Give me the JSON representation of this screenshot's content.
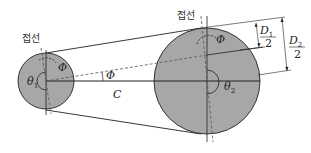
{
  "diagram": {
    "type": "belt-pulley-geometry",
    "colors": {
      "pulley_fill": "#a7a7a7",
      "line": "#222222",
      "dashed": "#555555"
    },
    "labels": {
      "tangent_left": "접선",
      "tangent_right": "접선",
      "phi_small": "Φ",
      "phi_center": "Φ",
      "phi_large": "Φ",
      "theta1": "θ",
      "theta1_sub": "1",
      "theta2": "θ",
      "theta2_sub": "2",
      "center_distance": "C",
      "d1_num": "D",
      "d1_num_sub": "1",
      "d1_den": "2",
      "d2_num": "D",
      "d2_num_sub": "2",
      "d2_den": "2"
    },
    "pulleys": [
      {
        "name": "small-pulley",
        "cx": 46,
        "cy": 81,
        "r": 28
      },
      {
        "name": "large-pulley",
        "cx": 207,
        "cy": 81,
        "r": 53
      }
    ]
  }
}
